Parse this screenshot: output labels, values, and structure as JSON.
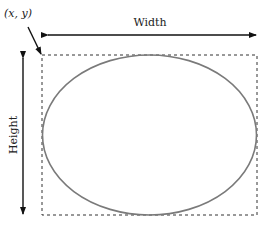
{
  "diagram": {
    "origin_label": "(x, y)",
    "width_label": "Width",
    "height_label": "Height",
    "colors": {
      "ellipse_stroke": "#7a7a7a",
      "rect_stroke": "#333333",
      "arrow": "#111111",
      "text": "#222222"
    }
  }
}
